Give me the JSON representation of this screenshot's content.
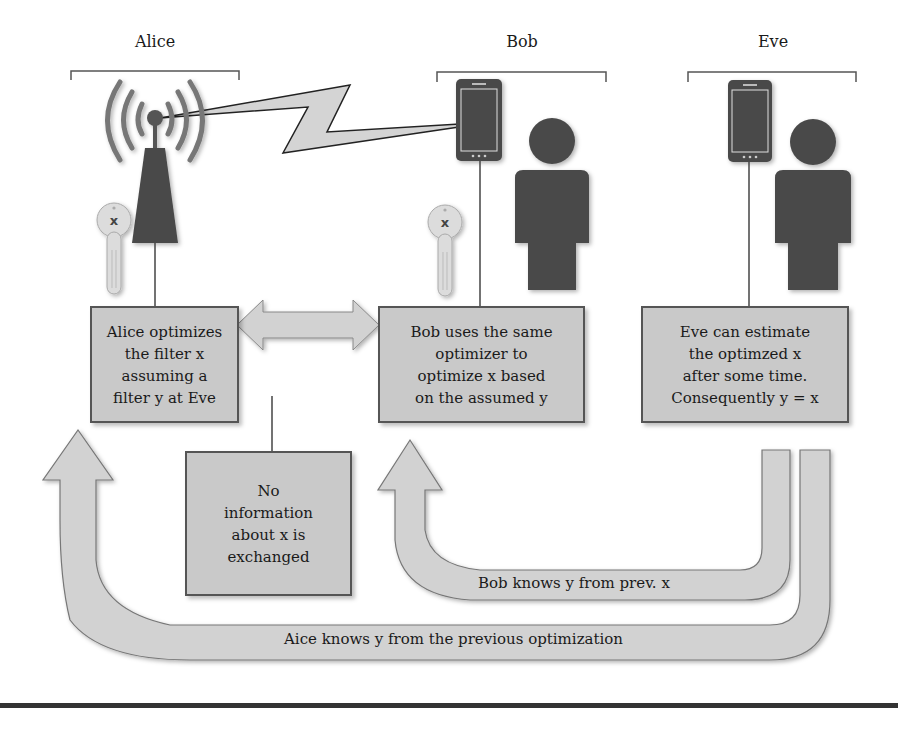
{
  "diagram": {
    "parties": [
      {
        "name": "Alice",
        "device": "antenna-tower",
        "has_key": true
      },
      {
        "name": "Bob",
        "device": "smartphone",
        "has_key": true
      },
      {
        "name": "Eve",
        "device": "smartphone",
        "has_key": false
      }
    ],
    "key_label": "x",
    "boxes": {
      "alice": "Alice optimizes\nthe filter x\nassuming a\nfilter y at Eve",
      "bob": "Bob uses the same\noptimizer to\noptimize x based\non the assumed y",
      "eve": "Eve can estimate\nthe optimzed x\nafter some time.\nConsequently y = x",
      "no_info": "No\ninformation\nabout x is\nexchanged"
    },
    "arrows": {
      "bob_feedback": "Bob knows y from prev. x",
      "alice_feedback": "Aice knows y from the previous optimization"
    },
    "colors": {
      "box_fill": "#c9c9c9",
      "arrow_fill": "#d2d2d2",
      "icon_dark": "#4a4a4a",
      "outline": "#555555"
    }
  }
}
